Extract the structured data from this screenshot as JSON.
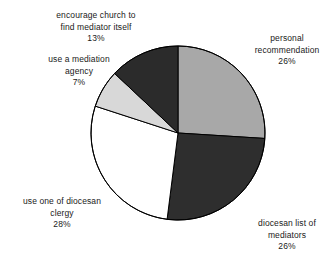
{
  "chart_data": {
    "type": "pie",
    "title": "",
    "subtitle": "",
    "xlabel": "",
    "ylabel": "",
    "legend_position": "none",
    "grid": false,
    "start_angle_deg": 0,
    "direction": "clockwise",
    "units": "percent",
    "total": 100,
    "categories": [
      "personal recommendation",
      "diocesan list of mediators",
      "use one of diocesan clergy",
      "use a mediation agency",
      "encourage church to find mediator itself"
    ],
    "values": [
      26,
      26,
      28,
      7,
      13
    ],
    "slices": [
      {
        "name": "personal-recommendation",
        "lines": [
          "personal",
          "recommendation"
        ],
        "value": 26,
        "value_label": "26%",
        "color": "#a8a8a8",
        "start_deg": 0,
        "end_deg": 93.6
      },
      {
        "name": "diocesan-list-of-mediators",
        "lines": [
          "diocesan list of",
          "mediators"
        ],
        "value": 26,
        "value_label": "26%",
        "color": "#2e2e2e",
        "start_deg": 93.6,
        "end_deg": 187.2
      },
      {
        "name": "use-one-of-diocesan-clergy",
        "lines": [
          "use one of diocesan",
          "clergy"
        ],
        "value": 28,
        "value_label": "28%",
        "color": "#ffffff",
        "start_deg": 187.2,
        "end_deg": 288.0
      },
      {
        "name": "use-a-mediation-agency",
        "lines": [
          "use a mediation",
          "agency"
        ],
        "value": 7,
        "value_label": "7%",
        "color": "#d8d8d8",
        "start_deg": 288.0,
        "end_deg": 313.2
      },
      {
        "name": "encourage-church-to-find-mediator-itself",
        "lines": [
          "encourage church to",
          "find mediator itself"
        ],
        "value": 13,
        "value_label": "13%",
        "color": "#2b2b2b",
        "start_deg": 313.2,
        "end_deg": 360.0
      }
    ],
    "style": {
      "outline_color": "#000000",
      "outline_width": 1,
      "background": "#ffffff",
      "text_color": "#1a1a1a"
    },
    "geometry": {
      "center_x": 178,
      "center_y": 133,
      "radius": 87
    }
  }
}
